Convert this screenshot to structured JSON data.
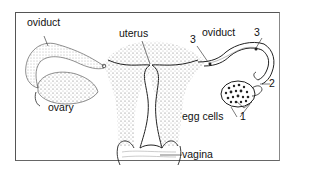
{
  "diagram": {
    "labels": {
      "oviduct_left": "oviduct",
      "uterus": "uterus",
      "oviduct_right": "oviduct",
      "ovary": "ovary",
      "egg_cells": "egg cells",
      "vagina": "vagina",
      "num_3_left": "3",
      "num_3_right": "3",
      "num_2": "2",
      "num_1": "1"
    },
    "colors": {
      "line": "#222222",
      "stipple": "#555555",
      "border": "#555555"
    }
  }
}
